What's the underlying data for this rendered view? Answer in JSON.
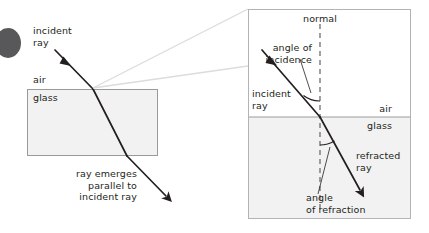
{
  "figure": {
    "type": "physics-optics-diagram",
    "topic": "refraction of light through a glass block",
    "colors": {
      "ray": "#231f20",
      "text": "#231f20",
      "panel_border": "#b3b3b3",
      "block_border": "#9a9a9a",
      "block_fill": "#f2f2f2",
      "connector": "#dcdcdc",
      "normal_dash": "#6d6d6d",
      "bullet": "#58585a",
      "background": "#ffffff"
    }
  },
  "left_panel": {
    "incident_ray_label": "incident\nray",
    "air_label": "air",
    "glass_label": "glass",
    "caption": "ray emerges\nparallel to\nincident ray"
  },
  "right_panel": {
    "normal_label": "normal",
    "angle_of_incidence_label": "angle of\nincidence",
    "incident_ray_label": "incident\nray",
    "air_label": "air",
    "glass_label": "glass",
    "refracted_ray_label": "refracted\nray",
    "angle_of_refraction_label": "angle\nof refraction"
  }
}
